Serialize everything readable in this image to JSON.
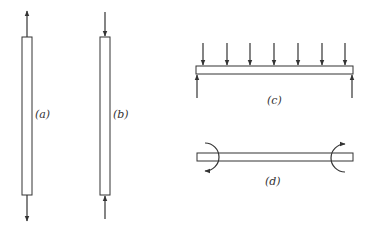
{
  "figure": {
    "colors": {
      "stroke": "#333333",
      "background": "#ffffff"
    },
    "panels": [
      {
        "id": "a",
        "label": "(a)",
        "type": "axial-tension",
        "member": "vertical-bar",
        "loads": [
          "upward force at top",
          "downward force at bottom"
        ]
      },
      {
        "id": "b",
        "label": "(b)",
        "type": "axial-compression",
        "member": "vertical-bar",
        "loads": [
          "downward force at top",
          "upward force at bottom"
        ]
      },
      {
        "id": "c",
        "label": "(c)",
        "type": "transverse-loading",
        "member": "horizontal-beam",
        "loads": [
          "7 downward point loads",
          "2 upward end reactions"
        ]
      },
      {
        "id": "d",
        "label": "(d)",
        "type": "bending-moments",
        "member": "horizontal-beam",
        "loads": [
          "end couple at left",
          "end couple at right"
        ]
      }
    ]
  }
}
